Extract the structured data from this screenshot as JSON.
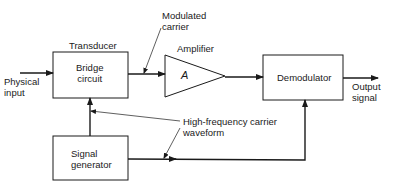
{
  "diagram": {
    "blocks": {
      "transducer": {
        "title": "Transducer",
        "body": "Bridge\ncircuit"
      },
      "amplifier": {
        "title": "Amplifier",
        "symbol": "A"
      },
      "demodulator": {
        "body": "Demodulator"
      },
      "signal_generator": {
        "body": "Signal\ngenerator"
      }
    },
    "labels": {
      "input": "Physical\ninput",
      "output": "Output\nsignal",
      "modulated_carrier": "Modulated\ncarrier",
      "carrier_waveform": "High-frequency carrier\nwaveform"
    },
    "colors": {
      "line": "#1a1a1a",
      "background": "#ffffff"
    }
  }
}
